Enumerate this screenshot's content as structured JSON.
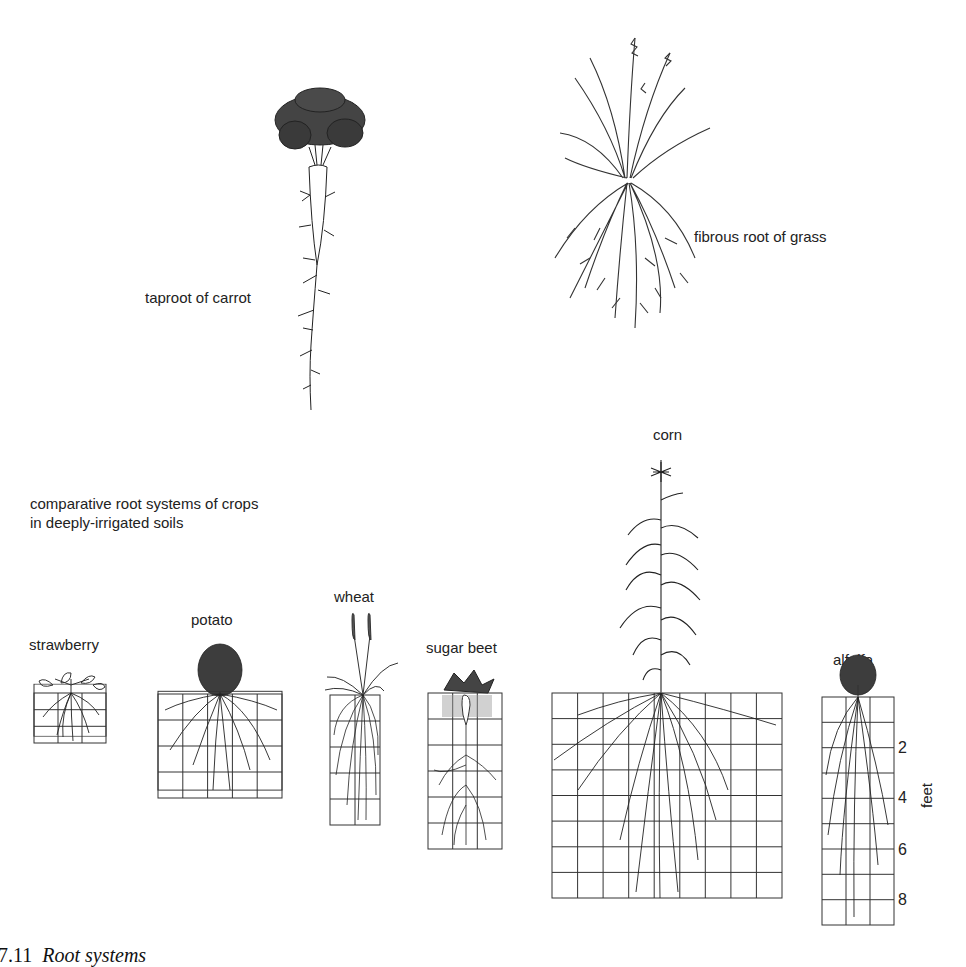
{
  "figure": {
    "caption_number": "7.11",
    "caption_title": "Root systems",
    "subtitle_line1": "comparative root systems of crops",
    "subtitle_line2": "in deeply-irrigated soils"
  },
  "top_illustrations": {
    "carrot": {
      "label": "taproot of carrot",
      "icon": "carrot-taproot-icon"
    },
    "grass": {
      "label": "fibrous root of grass",
      "icon": "grass-fibrous-root-icon"
    }
  },
  "scale": {
    "unit": "feet",
    "ticks": [
      "2",
      "4",
      "6",
      "8"
    ],
    "cell_size_ft": 1
  },
  "crops": [
    {
      "name": "strawberry",
      "grid_cols": 3,
      "grid_rows": 3,
      "root_depth_ft": 3
    },
    {
      "name": "potato",
      "grid_cols": 5,
      "grid_rows": 4,
      "root_depth_ft": 4
    },
    {
      "name": "wheat",
      "grid_cols": 2,
      "grid_rows": 5,
      "root_depth_ft": 5
    },
    {
      "name": "sugar beet",
      "grid_cols": 3,
      "grid_rows": 6,
      "root_depth_ft": 6
    },
    {
      "name": "corn",
      "grid_cols": 9,
      "grid_rows": 8,
      "root_depth_ft": 8
    },
    {
      "name": "alfalfa",
      "grid_cols": 3,
      "grid_rows": 9,
      "root_depth_ft": 9
    }
  ]
}
